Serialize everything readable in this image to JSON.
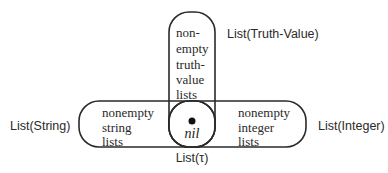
{
  "diagram": {
    "regions": {
      "truth_value": {
        "label": "List(Truth-Value)",
        "inner_lines": [
          "non-",
          "empty",
          "truth-",
          "value",
          "lists"
        ]
      },
      "string": {
        "label": "List(String)",
        "inner_lines": [
          "nonempty",
          "string",
          "lists"
        ]
      },
      "integer": {
        "label": "List(Integer)",
        "inner_lines": [
          "nonempty",
          "integer",
          "lists"
        ]
      },
      "tau": {
        "label": "List(τ)",
        "center_label": "nil"
      }
    },
    "colors": {
      "stroke": "#2a2a2a",
      "background": "#ffffff"
    }
  }
}
